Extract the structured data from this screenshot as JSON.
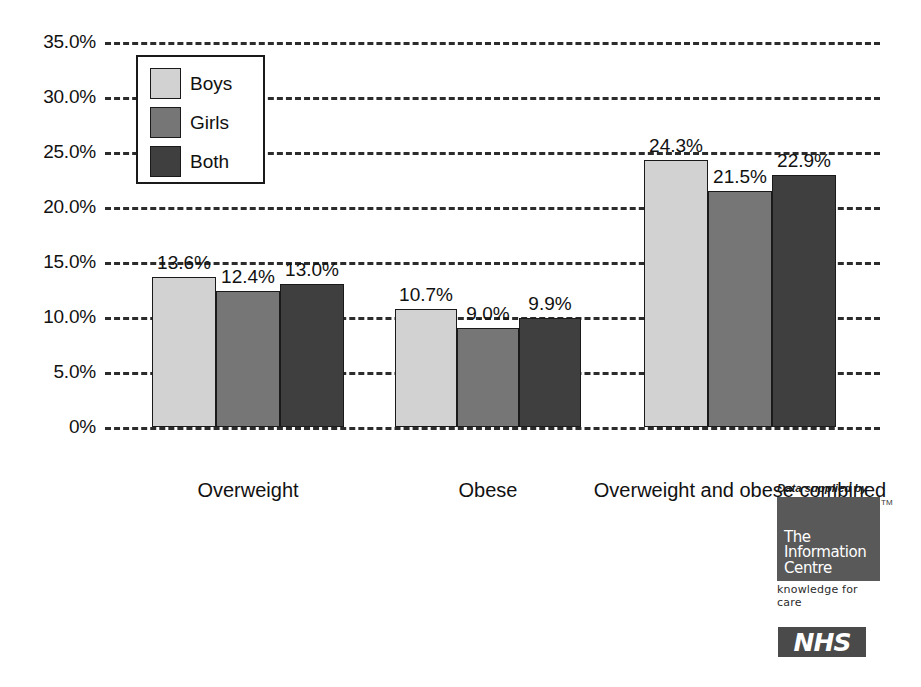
{
  "chart_data": {
    "type": "bar",
    "title": "",
    "subtitle": "",
    "xlabel": "",
    "ylabel": "",
    "ylim": [
      0,
      35
    ],
    "grid": true,
    "legend_position": "top-left-inside",
    "categories": [
      "Overweight",
      "Obese",
      "Overweight and obese combined"
    ],
    "y_ticks": [
      0,
      5,
      10,
      15,
      20,
      25,
      30,
      35
    ],
    "y_tick_labels": [
      "0%",
      "5.0%",
      "10.0%",
      "15.0%",
      "20.0%",
      "25.0%",
      "30.0%",
      "35.0%"
    ],
    "series": [
      {
        "name": "Boys",
        "color": "#d2d2d2",
        "values": [
          13.6,
          10.7,
          24.3
        ],
        "value_labels": [
          "13.6%",
          "10.7%",
          "24.3%"
        ]
      },
      {
        "name": "Girls",
        "color": "#767676",
        "values": [
          12.4,
          9.0,
          21.5
        ],
        "value_labels": [
          "12.4%",
          "9.0%",
          "21.5%"
        ]
      },
      {
        "name": "Both",
        "color": "#3f3f3f",
        "values": [
          13.0,
          9.9,
          22.9
        ],
        "value_labels": [
          "13.0%",
          "9.9%",
          "22.9%"
        ]
      }
    ]
  },
  "attribution": {
    "supplied_by": "Data supplied by",
    "trademark": "TM",
    "logo_line1": "The",
    "logo_line2": "Information",
    "logo_line3": "Centre",
    "tagline": "knowledge for care",
    "nhs": "NHS"
  }
}
